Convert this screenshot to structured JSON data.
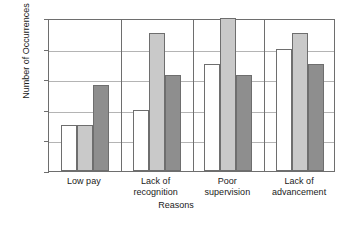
{
  "chart_data": {
    "type": "bar",
    "title": "",
    "xlabel": "Reasons",
    "ylabel": "Number of Occurrences",
    "categories": [
      "Low pay",
      "Lack of recognition",
      "Poor supervision",
      "Lack of advancement"
    ],
    "category_lines": [
      [
        "Low pay"
      ],
      [
        "Lack of",
        "recognition"
      ],
      [
        "Poor",
        "supervision"
      ],
      [
        "Lack of",
        "advancement"
      ]
    ],
    "series": [
      {
        "name": "Series 1",
        "color": "#ffffff",
        "values": [
          3,
          4,
          7,
          8
        ]
      },
      {
        "name": "Series 2",
        "color": "#c9c9c9",
        "values": [
          3,
          9,
          10,
          9
        ]
      },
      {
        "name": "Series 3",
        "color": "#8e8e8e",
        "values": [
          5.6,
          6.3,
          6.3,
          7
        ]
      }
    ],
    "ylim": [
      0,
      10
    ],
    "yticks": [
      0,
      2,
      4,
      6,
      8,
      10
    ],
    "ytick_labels": [
      "0",
      "2",
      "4",
      "6",
      "8",
      "10"
    ],
    "grid": true,
    "legend": "none",
    "frame_color": "#6e6e6e",
    "grid_color": "#b4b4b4",
    "background": "#ffffff"
  }
}
